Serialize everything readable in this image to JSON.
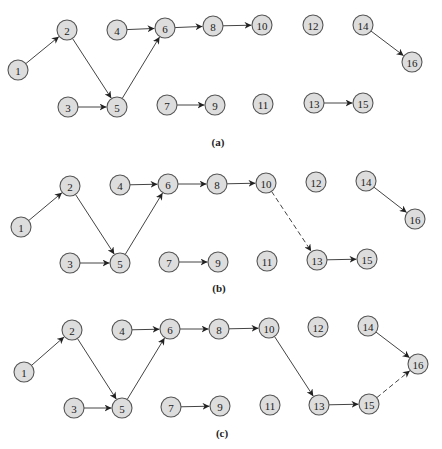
{
  "node_radius": 10,
  "colors": {
    "node_fill": "#dddddd",
    "node_stroke": "#555555",
    "edge": "#444444",
    "text": "#222222"
  },
  "panels": [
    {
      "label": "(a)",
      "label_pos": [
        218,
        146
      ],
      "nodes": [
        {
          "id": "1",
          "x": 18,
          "y": 70
        },
        {
          "id": "2",
          "x": 67,
          "y": 30
        },
        {
          "id": "3",
          "x": 68,
          "y": 107
        },
        {
          "id": "4",
          "x": 117,
          "y": 30
        },
        {
          "id": "5",
          "x": 117,
          "y": 107
        },
        {
          "id": "6",
          "x": 165,
          "y": 28
        },
        {
          "id": "7",
          "x": 167,
          "y": 105
        },
        {
          "id": "8",
          "x": 213,
          "y": 26
        },
        {
          "id": "9",
          "x": 215,
          "y": 105
        },
        {
          "id": "10",
          "x": 262,
          "y": 25
        },
        {
          "id": "11",
          "x": 263,
          "y": 104
        },
        {
          "id": "12",
          "x": 313,
          "y": 25
        },
        {
          "id": "13",
          "x": 314,
          "y": 103
        },
        {
          "id": "14",
          "x": 363,
          "y": 25
        },
        {
          "id": "15",
          "x": 363,
          "y": 103
        },
        {
          "id": "16",
          "x": 412,
          "y": 62
        }
      ],
      "edges": [
        {
          "from": "1",
          "to": "2",
          "style": "solid"
        },
        {
          "from": "2",
          "to": "5",
          "style": "solid"
        },
        {
          "from": "3",
          "to": "5",
          "style": "solid"
        },
        {
          "from": "4",
          "to": "6",
          "style": "solid"
        },
        {
          "from": "5",
          "to": "6",
          "style": "solid"
        },
        {
          "from": "6",
          "to": "8",
          "style": "solid"
        },
        {
          "from": "8",
          "to": "10",
          "style": "solid"
        },
        {
          "from": "7",
          "to": "9",
          "style": "solid"
        },
        {
          "from": "14",
          "to": "16",
          "style": "solid"
        },
        {
          "from": "13",
          "to": "15",
          "style": "solid"
        }
      ]
    },
    {
      "label": "(b)",
      "label_pos": [
        219,
        292
      ],
      "nodes": [
        {
          "id": "1",
          "x": 21,
          "y": 227
        },
        {
          "id": "2",
          "x": 70,
          "y": 186
        },
        {
          "id": "3",
          "x": 70,
          "y": 263
        },
        {
          "id": "4",
          "x": 120,
          "y": 185
        },
        {
          "id": "5",
          "x": 120,
          "y": 263
        },
        {
          "id": "6",
          "x": 168,
          "y": 184
        },
        {
          "id": "7",
          "x": 169,
          "y": 262
        },
        {
          "id": "8",
          "x": 217,
          "y": 184
        },
        {
          "id": "9",
          "x": 218,
          "y": 262
        },
        {
          "id": "10",
          "x": 266,
          "y": 183
        },
        {
          "id": "11",
          "x": 267,
          "y": 261
        },
        {
          "id": "12",
          "x": 316,
          "y": 182
        },
        {
          "id": "13",
          "x": 317,
          "y": 260
        },
        {
          "id": "14",
          "x": 366,
          "y": 181
        },
        {
          "id": "15",
          "x": 367,
          "y": 259
        },
        {
          "id": "16",
          "x": 415,
          "y": 219
        }
      ],
      "edges": [
        {
          "from": "1",
          "to": "2",
          "style": "solid"
        },
        {
          "from": "2",
          "to": "5",
          "style": "solid"
        },
        {
          "from": "3",
          "to": "5",
          "style": "solid"
        },
        {
          "from": "4",
          "to": "6",
          "style": "solid"
        },
        {
          "from": "5",
          "to": "6",
          "style": "solid"
        },
        {
          "from": "6",
          "to": "8",
          "style": "solid"
        },
        {
          "from": "8",
          "to": "10",
          "style": "solid"
        },
        {
          "from": "7",
          "to": "9",
          "style": "solid"
        },
        {
          "from": "10",
          "to": "13",
          "style": "dashed"
        },
        {
          "from": "14",
          "to": "16",
          "style": "solid"
        },
        {
          "from": "13",
          "to": "15",
          "style": "solid"
        }
      ]
    },
    {
      "label": "(c)",
      "label_pos": [
        222,
        437
      ],
      "nodes": [
        {
          "id": "1",
          "x": 24,
          "y": 372
        },
        {
          "id": "2",
          "x": 72,
          "y": 330
        },
        {
          "id": "3",
          "x": 74,
          "y": 408
        },
        {
          "id": "4",
          "x": 122,
          "y": 330
        },
        {
          "id": "5",
          "x": 122,
          "y": 408
        },
        {
          "id": "6",
          "x": 170,
          "y": 329
        },
        {
          "id": "7",
          "x": 171,
          "y": 407
        },
        {
          "id": "8",
          "x": 219,
          "y": 329
        },
        {
          "id": "9",
          "x": 220,
          "y": 406
        },
        {
          "id": "10",
          "x": 269,
          "y": 328
        },
        {
          "id": "11",
          "x": 270,
          "y": 405
        },
        {
          "id": "12",
          "x": 318,
          "y": 327
        },
        {
          "id": "13",
          "x": 319,
          "y": 405
        },
        {
          "id": "14",
          "x": 368,
          "y": 326
        },
        {
          "id": "15",
          "x": 369,
          "y": 404
        },
        {
          "id": "16",
          "x": 418,
          "y": 364
        }
      ],
      "edges": [
        {
          "from": "1",
          "to": "2",
          "style": "solid"
        },
        {
          "from": "2",
          "to": "5",
          "style": "solid"
        },
        {
          "from": "3",
          "to": "5",
          "style": "solid"
        },
        {
          "from": "4",
          "to": "6",
          "style": "solid"
        },
        {
          "from": "5",
          "to": "6",
          "style": "solid"
        },
        {
          "from": "6",
          "to": "8",
          "style": "solid"
        },
        {
          "from": "8",
          "to": "10",
          "style": "solid"
        },
        {
          "from": "7",
          "to": "9",
          "style": "solid"
        },
        {
          "from": "10",
          "to": "13",
          "style": "solid"
        },
        {
          "from": "14",
          "to": "16",
          "style": "solid"
        },
        {
          "from": "13",
          "to": "15",
          "style": "solid"
        },
        {
          "from": "15",
          "to": "16",
          "style": "dashed"
        }
      ]
    }
  ]
}
